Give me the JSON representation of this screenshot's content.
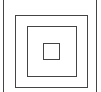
{
  "diagram": {
    "title": "",
    "stroke_color": "#444444",
    "background": "#ffffff",
    "squares": [
      {
        "name": "outer",
        "x": 3,
        "y": -1,
        "w": 94,
        "h": 94
      },
      {
        "name": "second",
        "x": 15,
        "y": 15,
        "w": 73,
        "h": 73
      },
      {
        "name": "third",
        "x": 27,
        "y": 26,
        "w": 50,
        "h": 51
      },
      {
        "name": "inner",
        "x": 43,
        "y": 43,
        "w": 17,
        "h": 17
      }
    ]
  }
}
